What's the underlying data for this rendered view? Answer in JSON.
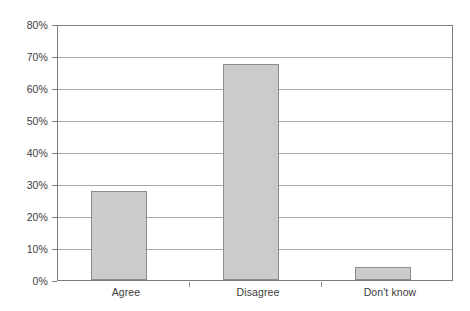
{
  "chart_data": {
    "type": "bar",
    "title": "",
    "subtitle": "",
    "xlabel": "",
    "ylabel": "",
    "categories": [
      "Agree",
      "Disagree",
      "Don't know"
    ],
    "values": [
      28,
      68,
      4
    ],
    "value_unit": "%",
    "ylim": [
      0,
      80
    ],
    "ytick_step": 10,
    "ytick_labels": [
      "0%",
      "10%",
      "20%",
      "30%",
      "40%",
      "50%",
      "60%",
      "70%",
      "80%"
    ],
    "ytick_values": [
      0,
      10,
      20,
      30,
      40,
      50,
      60,
      70,
      80
    ],
    "grid": true,
    "grid_axis": "y",
    "legend": false,
    "legend_position": "none",
    "series": [
      {
        "name": "Response share",
        "values": [
          28,
          68,
          4
        ]
      }
    ],
    "colors": {
      "bar_fill": "#cbcbcb",
      "bar_border": "#8c8c8c",
      "gridline": "#a8a8a8",
      "axis": "#7d7d7d",
      "background": "#ffffff",
      "text": "#3c3c3c"
    }
  }
}
